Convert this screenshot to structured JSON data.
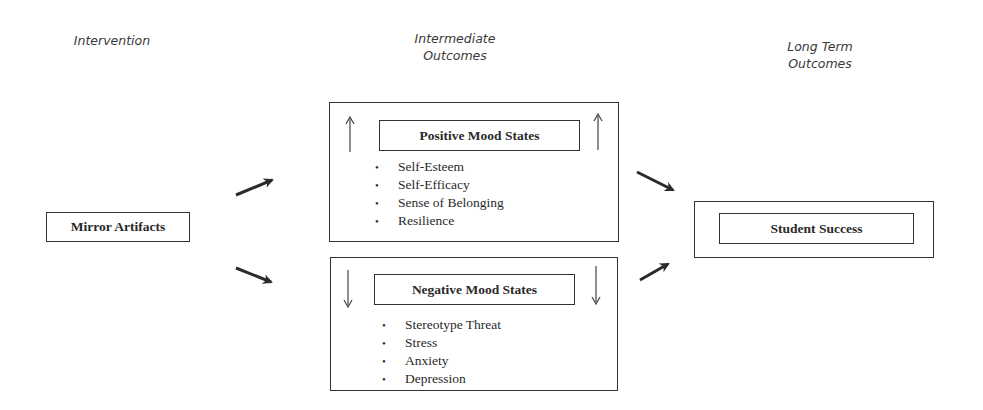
{
  "headers": {
    "intervention": "Intervention",
    "intermediate_line1": "Intermediate",
    "intermediate_line2": "Outcomes",
    "longterm_line1": "Long Term",
    "longterm_line2": "Outcomes"
  },
  "intervention_box": {
    "label": "Mirror Artifacts"
  },
  "positive_box": {
    "title": "Positive Mood States",
    "direction": "up",
    "items": [
      "Self-Esteem",
      "Self-Efficacy",
      "Sense of Belonging",
      "Resilience"
    ]
  },
  "negative_box": {
    "title": "Negative Mood States",
    "direction": "down",
    "items": [
      "Stereotype Threat",
      "Stress",
      "Anxiety",
      "Depression"
    ]
  },
  "outcome_box": {
    "label": "Student Success"
  },
  "colors": {
    "line": "#333333",
    "text": "#2a2a2a",
    "header_text": "#3a3a3a",
    "background": "#ffffff"
  }
}
